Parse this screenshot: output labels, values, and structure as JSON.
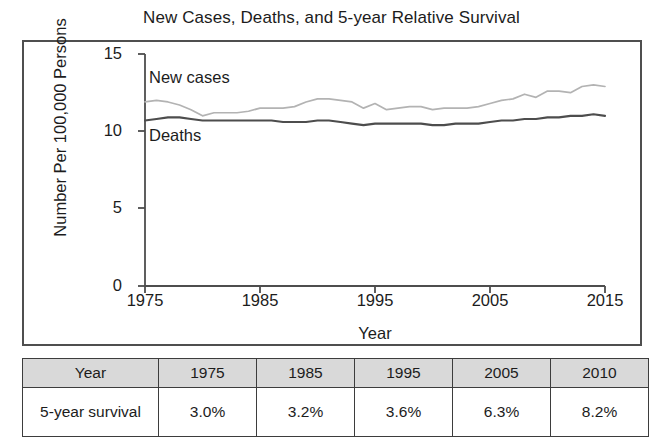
{
  "chart_data": {
    "type": "line",
    "title": "New Cases, Deaths, and 5-year Relative Survival",
    "xlabel": "Year",
    "ylabel": "Number Per 100,000 Persons",
    "xlim": [
      1975,
      2015
    ],
    "ylim": [
      0,
      15
    ],
    "ytick_labels": [
      "0",
      "5",
      "10",
      "15"
    ],
    "yticks": [
      0,
      5,
      10,
      15
    ],
    "xtick_labels": [
      "1975",
      "1985",
      "1995",
      "2005",
      "2015"
    ],
    "xticks": [
      1975,
      1985,
      1995,
      2005,
      2015
    ],
    "grid": false,
    "legend_position": "inline-annotations",
    "series": [
      {
        "name": "New cases",
        "color": "#b3b3b3",
        "x": [
          1975,
          1976,
          1977,
          1978,
          1979,
          1980,
          1981,
          1982,
          1983,
          1984,
          1985,
          1986,
          1987,
          1988,
          1989,
          1990,
          1991,
          1992,
          1993,
          1994,
          1995,
          1996,
          1997,
          1998,
          1999,
          2000,
          2001,
          2002,
          2003,
          2004,
          2005,
          2006,
          2007,
          2008,
          2009,
          2010,
          2011,
          2012,
          2013,
          2014,
          2015
        ],
        "values": [
          11.9,
          12.0,
          11.9,
          11.7,
          11.4,
          11.0,
          11.2,
          11.2,
          11.2,
          11.3,
          11.5,
          11.5,
          11.5,
          11.6,
          11.9,
          12.1,
          12.1,
          12.0,
          11.9,
          11.5,
          11.8,
          11.4,
          11.5,
          11.6,
          11.6,
          11.4,
          11.5,
          11.5,
          11.5,
          11.6,
          11.8,
          12.0,
          12.1,
          12.4,
          12.2,
          12.6,
          12.6,
          12.5,
          12.9,
          13.0,
          12.9
        ]
      },
      {
        "name": "Deaths",
        "color": "#4d4d4d",
        "x": [
          1975,
          1976,
          1977,
          1978,
          1979,
          1980,
          1981,
          1982,
          1983,
          1984,
          1985,
          1986,
          1987,
          1988,
          1989,
          1990,
          1991,
          1992,
          1993,
          1994,
          1995,
          1996,
          1997,
          1998,
          1999,
          2000,
          2001,
          2002,
          2003,
          2004,
          2005,
          2006,
          2007,
          2008,
          2009,
          2010,
          2011,
          2012,
          2013,
          2014,
          2015
        ],
        "values": [
          10.7,
          10.8,
          10.9,
          10.9,
          10.8,
          10.7,
          10.7,
          10.7,
          10.7,
          10.7,
          10.7,
          10.7,
          10.6,
          10.6,
          10.6,
          10.7,
          10.7,
          10.6,
          10.5,
          10.4,
          10.5,
          10.5,
          10.5,
          10.5,
          10.5,
          10.4,
          10.4,
          10.5,
          10.5,
          10.5,
          10.6,
          10.7,
          10.7,
          10.8,
          10.8,
          10.9,
          10.9,
          11.0,
          11.0,
          11.1,
          11.0
        ]
      }
    ],
    "annotations": [
      {
        "text": "New cases",
        "x": 1978,
        "y": 13.4
      },
      {
        "text": "Deaths",
        "x": 1978,
        "y": 9.6
      }
    ]
  },
  "table": {
    "header": [
      "Year",
      "1975",
      "1985",
      "1995",
      "2005",
      "2010"
    ],
    "rows": [
      {
        "label": "5-year survival",
        "values": [
          "3.0%",
          "3.2%",
          "3.6%",
          "6.3%",
          "8.2%"
        ]
      }
    ]
  },
  "colors": {
    "new_cases_line": "#b3b3b3",
    "deaths_line": "#4d4d4d",
    "frame": "#4f4f4f",
    "table_header_bg": "#d9d9d9",
    "text": "#1c1c1c"
  }
}
